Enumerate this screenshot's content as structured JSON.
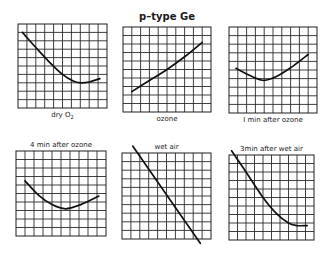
{
  "figure": {
    "title": "p–type Ge",
    "subscript_note": "O2"
  },
  "chart_data": [
    {
      "type": "line",
      "title": "dry O2",
      "label": "dry O",
      "label_sub": "2",
      "label_position": "below",
      "grid": {
        "cols": 10,
        "rows": 10
      },
      "box": [
        18,
        24,
        107,
        108
      ],
      "x": [
        0.05,
        0.2,
        0.35,
        0.5,
        0.62,
        0.7,
        0.8,
        0.92
      ],
      "y": [
        0.9,
        0.72,
        0.55,
        0.4,
        0.32,
        0.3,
        0.31,
        0.35
      ]
    },
    {
      "type": "line",
      "title": "ozone",
      "label": "ozone",
      "label_position": "below",
      "grid": {
        "cols": 10,
        "rows": 10
      },
      "box": [
        123,
        27,
        211,
        112
      ],
      "x": [
        0.1,
        0.3,
        0.5,
        0.7,
        0.9
      ],
      "y": [
        0.24,
        0.37,
        0.5,
        0.65,
        0.82
      ]
    },
    {
      "type": "line",
      "title": "1 min after ozone",
      "label": "I min after ozone",
      "label_position": "below",
      "grid": {
        "cols": 10,
        "rows": 10
      },
      "box": [
        229,
        27,
        317,
        113
      ],
      "x": [
        0.08,
        0.25,
        0.4,
        0.55,
        0.72,
        0.9
      ],
      "y": [
        0.52,
        0.43,
        0.38,
        0.43,
        0.54,
        0.68
      ]
    },
    {
      "type": "line",
      "title": "4 min after ozone",
      "label": "4 min  after ozone",
      "label_position": "above",
      "grid": {
        "cols": 10,
        "rows": 10
      },
      "box": [
        16,
        151,
        106,
        236
      ],
      "x": [
        0.1,
        0.25,
        0.4,
        0.55,
        0.72,
        0.92
      ],
      "y": [
        0.65,
        0.48,
        0.37,
        0.32,
        0.37,
        0.47
      ]
    },
    {
      "type": "line",
      "title": "wet air",
      "label": "wet air",
      "label_position": "above",
      "grid": {
        "cols": 10,
        "rows": 10
      },
      "box": [
        122,
        153,
        211,
        239
      ],
      "x": [
        0.12,
        0.88
      ],
      "y": [
        1.08,
        -0.05
      ]
    },
    {
      "type": "line",
      "title": "3 min after wet air",
      "label": "3min after wet air",
      "label_position": "above",
      "grid": {
        "cols": 10,
        "rows": 10
      },
      "box": [
        229,
        155,
        314,
        240
      ],
      "x": [
        0.03,
        0.2,
        0.4,
        0.55,
        0.7,
        0.8,
        0.92
      ],
      "y": [
        1.05,
        0.8,
        0.5,
        0.32,
        0.2,
        0.17,
        0.17
      ]
    }
  ]
}
